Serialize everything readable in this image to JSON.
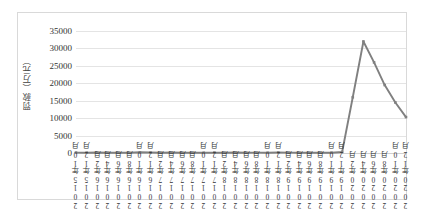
{
  "chart_data": {
    "type": "line",
    "title": "",
    "xlabel": "",
    "ylabel": "罚款（万元）",
    "ylim": [
      0,
      35000
    ],
    "ytick_labels": [
      "35000",
      "30000",
      "25000",
      "20000",
      "15000",
      "10000",
      "5000",
      "0"
    ],
    "ytick_values": [
      35000,
      30000,
      25000,
      20000,
      15000,
      10000,
      5000,
      0
    ],
    "grid": true,
    "legend": "none",
    "series_name": "罚款",
    "line_color": "#808080",
    "marker": "square",
    "categories": [
      "2015年10月",
      "2015年12月",
      "2016年2月",
      "2016年4月",
      "2016年6月",
      "2016年8月",
      "2016年10月",
      "2016年12月",
      "2017年2月",
      "2017年4月",
      "2017年6月",
      "2017年8月",
      "2017年10月",
      "2017年12月",
      "2018年2月",
      "2018年4月",
      "2018年6月",
      "2018年8月",
      "2018年10月",
      "2018年12月",
      "2019年2月",
      "2019年4月",
      "2019年6月",
      "2019年8月",
      "2019年10月",
      "2019年12月",
      "2020年2月",
      "2020年4月",
      "2020年6月",
      "2020年8月",
      "2020年10月",
      "2020年12月"
    ],
    "values": [
      120,
      90,
      150,
      80,
      110,
      60,
      200,
      130,
      90,
      140,
      70,
      100,
      60,
      120,
      80,
      150,
      90,
      110,
      70,
      130,
      100,
      80,
      60,
      120,
      90,
      300,
      16000,
      32000,
      26000,
      19500,
      14500,
      10300
    ]
  }
}
